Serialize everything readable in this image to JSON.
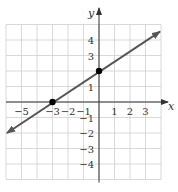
{
  "chart_data": {
    "type": "line",
    "title": "",
    "xlabel": "x",
    "ylabel": "y",
    "xlim": [
      -6,
      4
    ],
    "ylim": [
      -5,
      5
    ],
    "grid": true,
    "x_tick_labels": [
      "-5",
      "-3",
      "-2",
      "-1",
      "1",
      "2",
      "3"
    ],
    "x_tick_values": [
      -5,
      -3,
      -2,
      -1,
      1,
      2,
      3
    ],
    "y_tick_labels": [
      "4",
      "3",
      "1",
      "-1",
      "-2",
      "-3",
      "-4"
    ],
    "y_tick_values": [
      4,
      3,
      1,
      -1,
      -2,
      -3,
      -4
    ],
    "series": [
      {
        "name": "line",
        "equation": "y = (2/3)x + 2",
        "x": [
          -6,
          4
        ],
        "y": [
          -2,
          4.67
        ],
        "arrows": "both"
      }
    ],
    "points": [
      {
        "x": -3,
        "y": 0
      },
      {
        "x": 0,
        "y": 2
      }
    ],
    "colors": {
      "line": "#555555",
      "grid": "#cfcfcf",
      "axis": "#333333",
      "point": "#000000"
    }
  }
}
